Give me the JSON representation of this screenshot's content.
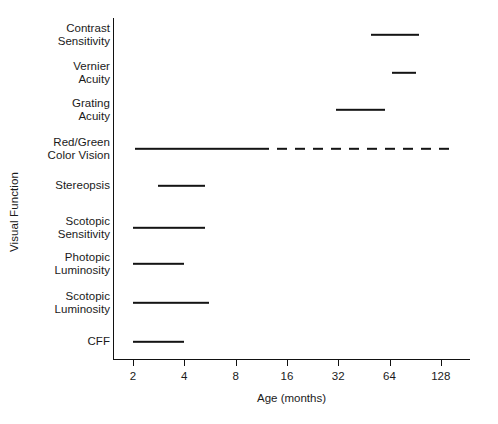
{
  "chart_data": {
    "type": "bar",
    "title": "",
    "xlabel": "Age (months)",
    "ylabel": "Visual Function",
    "xscale": "log2",
    "xlim": [
      1.7,
      200
    ],
    "grid": false,
    "legend": null,
    "xticks": [
      2,
      4,
      8,
      16,
      32,
      64,
      128
    ],
    "xticklabels": [
      "2",
      "4",
      "8",
      "16",
      "32",
      "64",
      "128"
    ],
    "categories": [
      "Contrast\nSensitivity",
      "Vernier\nAcuity",
      "Grating\nAcuity",
      "Red/Green\nColor Vision",
      "Stereopsis",
      "Scotopic\nSensitivity",
      "Photopic\nLuminosity",
      "Scotopic\nLuminosity",
      "CFF"
    ],
    "bars": [
      {
        "category": "Contrast Sensitivity",
        "start": 50,
        "end": 95,
        "style": "solid"
      },
      {
        "category": "Vernier Acuity",
        "start": 66,
        "end": 92,
        "style": "solid"
      },
      {
        "category": "Grating Acuity",
        "start": 31,
        "end": 60,
        "style": "solid"
      },
      {
        "category": "Red/Green Color Vision",
        "start": 2.05,
        "end": 11,
        "style": "solid"
      },
      {
        "category": "Red/Green Color Vision",
        "start": 11,
        "end": 150,
        "style": "dashed"
      },
      {
        "category": "Stereopsis",
        "start": 2.8,
        "end": 5.3,
        "style": "solid"
      },
      {
        "category": "Scotopic Sensitivity",
        "start": 2.0,
        "end": 5.3,
        "style": "solid"
      },
      {
        "category": "Photopic Luminosity",
        "start": 2.0,
        "end": 4.0,
        "style": "solid"
      },
      {
        "category": "Scotopic Luminosity",
        "start": 2.0,
        "end": 5.6,
        "style": "solid"
      },
      {
        "category": "CFF",
        "start": 2.0,
        "end": 4.0,
        "style": "solid"
      }
    ],
    "colors": {
      "bar": "#141414",
      "axis": "#111111",
      "text": "#1a1a1a",
      "background": "#ffffff"
    }
  },
  "artifact": {
    "faint_text": ""
  }
}
